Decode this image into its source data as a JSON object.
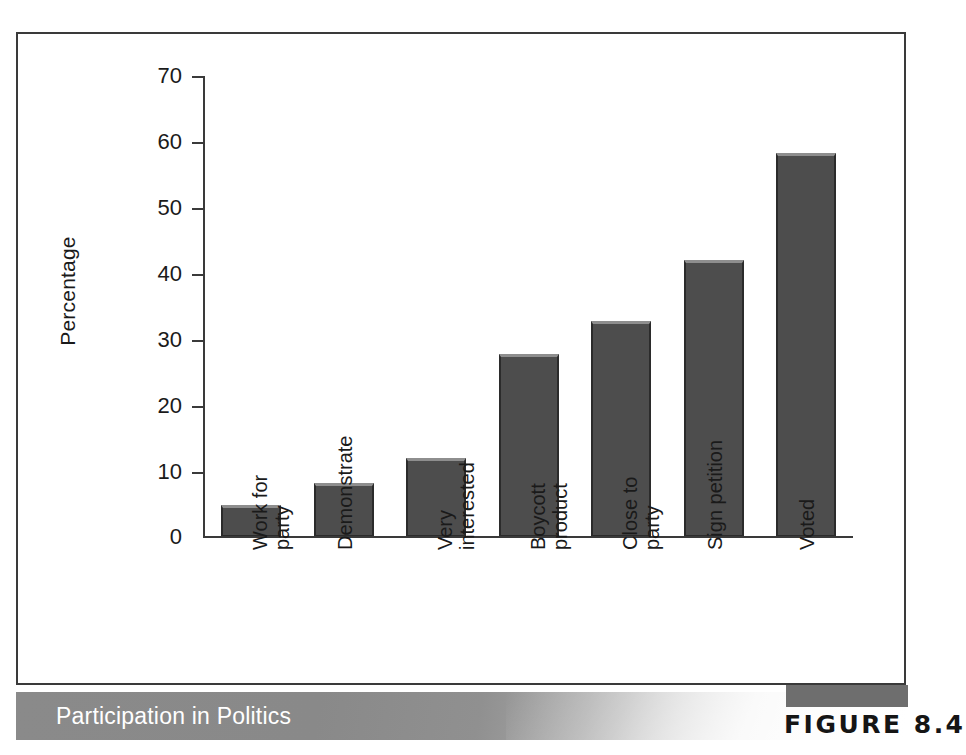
{
  "figure": {
    "caption": "Participation in Politics",
    "figure_label": "FIGURE 8.4"
  },
  "chart_data": {
    "type": "bar",
    "title": "Participation in Politics",
    "xlabel": "",
    "ylabel": "Percentage",
    "ylim": [
      0,
      70
    ],
    "yticks": [
      0,
      10,
      20,
      30,
      40,
      50,
      60,
      70
    ],
    "grid": false,
    "legend": null,
    "categories": [
      "Work for party",
      "Demonstrate",
      "Very interested",
      "Boycott product",
      "Close to party",
      "Sign petition",
      "Voted"
    ],
    "category_lines": [
      [
        "Work for",
        "party"
      ],
      [
        "Demonstrate"
      ],
      [
        "Very",
        "interested"
      ],
      [
        "Boycott",
        "product"
      ],
      [
        "Close to",
        "party"
      ],
      [
        "Sign petition"
      ],
      [
        "Voted"
      ]
    ],
    "values": [
      4.7,
      8.0,
      11.8,
      27.7,
      32.7,
      42.0,
      58.3
    ],
    "bar_color": "#4d4d4d",
    "bar_edge_color": "#2b2b2b",
    "bar_highlight_color": "#8e8e8e"
  },
  "axis": {
    "y_title": "Percentage",
    "y_labels": [
      "70",
      "60",
      "50",
      "40",
      "30",
      "20",
      "10",
      "0"
    ]
  }
}
